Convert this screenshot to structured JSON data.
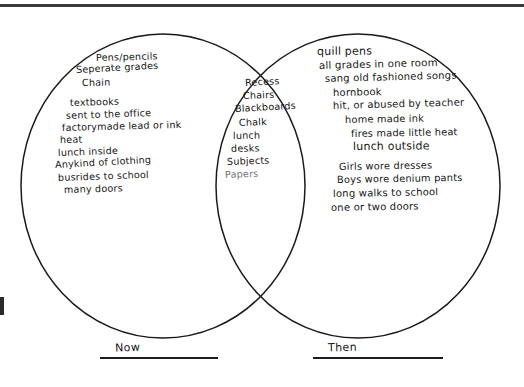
{
  "document": {
    "kind": "handwritten-venn-diagram",
    "title_visible": false,
    "ink_color": "#161616",
    "paper_color": "#ffffff"
  },
  "diagram": {
    "type": "venn",
    "circles": [
      {
        "id": "now",
        "label": "Now",
        "cx": 163,
        "cy": 186,
        "rx": 142,
        "ry": 152
      },
      {
        "id": "then",
        "label": "Then",
        "cx": 358,
        "cy": 186,
        "rx": 142,
        "ry": 152
      }
    ],
    "left_region": {
      "name": "now-only",
      "items": [
        "Pens/pencils",
        "Seperate grades",
        "Chain",
        "textbooks",
        "sent to the office",
        "factorymade lead or ink",
        "heat",
        "lunch inside",
        "Anykind of clothing",
        "busrides to school",
        "many doors"
      ]
    },
    "center_region": {
      "name": "both-overlap",
      "items": [
        "Recess",
        "Chairs",
        "Blackboards",
        "Chalk",
        "lunch",
        "desks",
        "Subjects",
        "Papers"
      ]
    },
    "right_region": {
      "name": "then-only",
      "items": [
        "quill pens",
        "all grades in one room",
        "sang old fashioned songs",
        "hornbook",
        "hit, or abused by teacher",
        "home made ink",
        "fires made little heat",
        "lunch outside",
        "Girls wore dresses",
        "Boys wore denium pants",
        "long walks to school",
        "one or two doors"
      ]
    },
    "labels": {
      "left": "Now",
      "right": "Then"
    }
  }
}
